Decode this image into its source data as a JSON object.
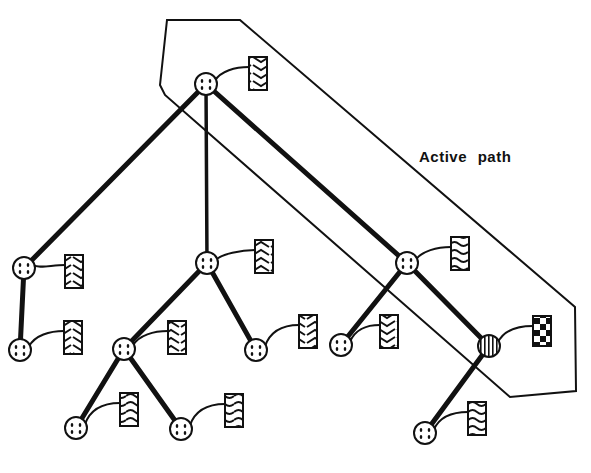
{
  "diagram": {
    "annotation": "Active path",
    "colors": {
      "ink": "#111111",
      "background": "#ffffff"
    },
    "active_region": [
      [
        167,
        20
      ],
      [
        240,
        20
      ],
      [
        575,
        307
      ],
      [
        576,
        391
      ],
      [
        510,
        397
      ],
      [
        165,
        95
      ],
      [
        160,
        85
      ]
    ],
    "nodes": [
      {
        "id": "root",
        "x": 206,
        "y": 84,
        "type": "dotted",
        "label_box": {
          "x": 249,
          "y": 57,
          "pattern": "chevron-down"
        }
      },
      {
        "id": "L1",
        "x": 24,
        "y": 268,
        "type": "dotted",
        "label_box": {
          "x": 65,
          "y": 255,
          "pattern": "chevron-down"
        }
      },
      {
        "id": "L1a",
        "x": 20,
        "y": 350,
        "type": "dotted",
        "label_box": {
          "x": 64,
          "y": 321,
          "pattern": "chevron-down"
        }
      },
      {
        "id": "M1",
        "x": 207,
        "y": 263,
        "type": "dotted",
        "label_box": {
          "x": 255,
          "y": 240,
          "pattern": "chevron-up"
        }
      },
      {
        "id": "M1a",
        "x": 124,
        "y": 349,
        "type": "dotted",
        "label_box": {
          "x": 168,
          "y": 321,
          "pattern": "chevron-up"
        }
      },
      {
        "id": "M1a1",
        "x": 76,
        "y": 428,
        "type": "dotted",
        "label_box": {
          "x": 120,
          "y": 393,
          "pattern": "wave"
        }
      },
      {
        "id": "M1a2",
        "x": 181,
        "y": 429,
        "type": "dotted",
        "label_box": {
          "x": 225,
          "y": 394,
          "pattern": "wave"
        }
      },
      {
        "id": "M1b",
        "x": 256,
        "y": 350,
        "type": "dotted",
        "label_box": {
          "x": 299,
          "y": 315,
          "pattern": "chevron-up"
        }
      },
      {
        "id": "R1",
        "x": 407,
        "y": 263,
        "type": "dotted",
        "label_box": {
          "x": 451,
          "y": 237,
          "pattern": "wave"
        }
      },
      {
        "id": "R1a",
        "x": 341,
        "y": 345,
        "type": "dotted",
        "label_box": {
          "x": 380,
          "y": 315,
          "pattern": "chevron-down"
        }
      },
      {
        "id": "R1b",
        "x": 489,
        "y": 346,
        "type": "striped",
        "label_box": {
          "x": 533,
          "y": 316,
          "pattern": "checker"
        }
      },
      {
        "id": "R1b1",
        "x": 425,
        "y": 433,
        "type": "dotted",
        "label_box": {
          "x": 468,
          "y": 402,
          "pattern": "wave"
        }
      }
    ],
    "edges": [
      {
        "from": "root",
        "to": "L1",
        "weight": "heavy"
      },
      {
        "from": "L1",
        "to": "L1a",
        "weight": "heavy"
      },
      {
        "from": "root",
        "to": "M1",
        "weight": "medium"
      },
      {
        "from": "M1",
        "to": "M1a",
        "weight": "heavy"
      },
      {
        "from": "M1",
        "to": "M1b",
        "weight": "heavy"
      },
      {
        "from": "M1a",
        "to": "M1a1",
        "weight": "heavy"
      },
      {
        "from": "M1a",
        "to": "M1a2",
        "weight": "heavy"
      },
      {
        "from": "root",
        "to": "R1",
        "weight": "heavy"
      },
      {
        "from": "R1",
        "to": "R1a",
        "weight": "heavy"
      },
      {
        "from": "R1",
        "to": "R1b",
        "weight": "heavy"
      },
      {
        "from": "R1b",
        "to": "R1b1",
        "weight": "heavy"
      }
    ]
  }
}
